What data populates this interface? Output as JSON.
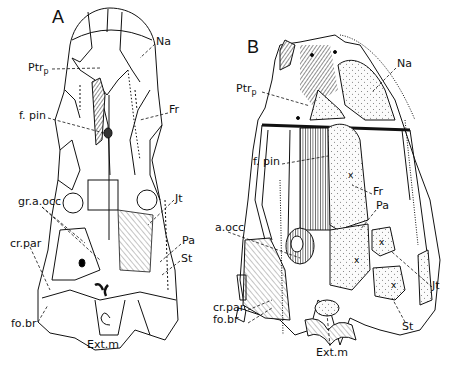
{
  "figure": {
    "panels": [
      {
        "id": "A",
        "label": "A",
        "view": "dorsal",
        "labels": [
          {
            "text": "Na",
            "x": 156,
            "y": 40
          },
          {
            "text": "Ptr",
            "sub": "p",
            "x": 28,
            "y": 63
          },
          {
            "text": "Fr",
            "x": 169,
            "y": 108
          },
          {
            "text": "f. pin",
            "x": 19,
            "y": 112
          },
          {
            "text": "gr.a.occ",
            "x": 18,
            "y": 199
          },
          {
            "text": "Jt",
            "x": 175,
            "y": 196
          },
          {
            "text": "Pa",
            "x": 182,
            "y": 239
          },
          {
            "text": "cr.par",
            "x": 10,
            "y": 241
          },
          {
            "text": "St",
            "x": 181,
            "y": 256
          },
          {
            "text": "fo.br",
            "x": 11,
            "y": 322
          },
          {
            "text": "Ext.m",
            "x": 87,
            "y": 343
          }
        ]
      },
      {
        "id": "B",
        "label": "B",
        "view": "oblique",
        "labels": [
          {
            "text": "Na",
            "x": 397,
            "y": 62
          },
          {
            "text": "Ptr",
            "sub": "p",
            "x": 236,
            "y": 86
          },
          {
            "text": "f. pin",
            "x": 253,
            "y": 159
          },
          {
            "text": "Fr",
            "x": 373,
            "y": 190
          },
          {
            "text": "Pa",
            "x": 376,
            "y": 204
          },
          {
            "text": "a.occ",
            "x": 215,
            "y": 226
          },
          {
            "text": "Jt",
            "x": 432,
            "y": 283
          },
          {
            "text": "cr.par",
            "x": 213,
            "y": 306
          },
          {
            "text": "fo.br",
            "x": 213,
            "y": 318
          },
          {
            "text": "St",
            "x": 402,
            "y": 324
          },
          {
            "text": "Ext.m",
            "x": 316,
            "y": 350
          }
        ]
      }
    ]
  },
  "colors": {
    "ink": "#111111",
    "background": "#ffffff",
    "stipple_fill": "#f4f4f4"
  }
}
